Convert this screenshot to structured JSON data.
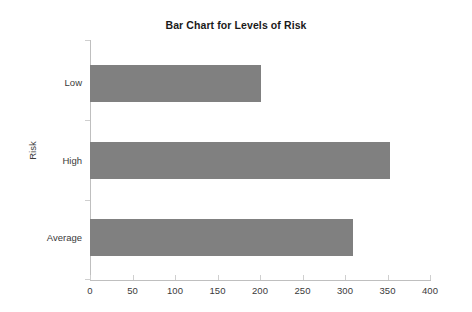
{
  "chart_data": {
    "type": "bar",
    "orientation": "horizontal",
    "title": "Bar Chart for Levels of Risk",
    "xlabel": "",
    "ylabel": "Risk",
    "categories": [
      "Low",
      "High",
      "Average"
    ],
    "values": [
      201,
      353,
      309
    ],
    "xlim": [
      0,
      400
    ],
    "xticks": [
      0,
      50,
      100,
      150,
      200,
      250,
      300,
      350,
      400
    ],
    "xtick_labels": [
      "0",
      "50",
      "100",
      "150",
      "200",
      "250",
      "300",
      "350",
      "400"
    ],
    "grid": false,
    "legend": null,
    "bar_color": "#808080",
    "axis_color": "#bfbfbf",
    "background": "#ffffff"
  }
}
